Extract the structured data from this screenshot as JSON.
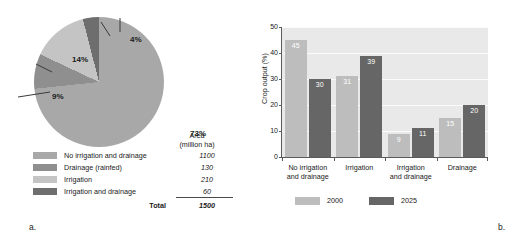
{
  "figure": {
    "panel_a_tag": "a.",
    "panel_b_tag": "b."
  },
  "colors": {
    "no_irrigation": "#a8a8a8",
    "drainage_rainfed": "#8f8f8f",
    "irrigation": "#c4c4c4",
    "irrigation_and_drainage": "#6e6e6e",
    "year_2000": "#bdbdbd",
    "year_2025": "#666666",
    "plot_background": "#e9e9e9",
    "gridline": "#fbfbfb",
    "axis": "#5a5a5a",
    "text": "#1a1a1a"
  },
  "pie_panel": {
    "labels": {
      "slice_73": "73%",
      "slice_14": "14%",
      "slice_9": "9%",
      "slice_4": "4%"
    },
    "legend_header_line1": "Area",
    "legend_header_line2": "(million ha)",
    "rows": [
      {
        "label": "No irrigation and drainage",
        "value": "1100",
        "color": "#a8a8a8"
      },
      {
        "label": "Drainage (rainfed)",
        "value": "130",
        "color": "#8f8f8f"
      },
      {
        "label": "Irrigation",
        "value": "210",
        "color": "#c4c4c4"
      },
      {
        "label": "Irrigation and drainage",
        "value": "60",
        "color": "#6e6e6e"
      }
    ],
    "total_label": "Total",
    "total_value": "1500"
  },
  "chart_data": [
    {
      "type": "pie",
      "title": "",
      "labels": [
        "No irrigation and drainage",
        "Drainage (rainfed)",
        "Irrigation",
        "Irrigation and drainage"
      ],
      "values": [
        1100,
        130,
        210,
        60
      ],
      "percent_labels": [
        "73%",
        "9%",
        "14%",
        "4%"
      ],
      "units": "million ha",
      "total": 1500,
      "colors": [
        "#a8a8a8",
        "#8f8f8f",
        "#c4c4c4",
        "#6e6e6e"
      ],
      "legend": "table at bottom with Area (million ha) column"
    },
    {
      "type": "bar",
      "title": "",
      "xlabel": "",
      "ylabel": "Crop output (%)",
      "categories": [
        "No irrigation and drainage",
        "Irrigation",
        "Irrigation and drainage",
        "Drainage"
      ],
      "category_lines": [
        [
          "No irrigation",
          "and drainage"
        ],
        [
          "Irrigation"
        ],
        [
          "Irrigation",
          "and drainage"
        ],
        [
          "Drainage"
        ]
      ],
      "series": [
        {
          "name": "2000",
          "values": [
            45,
            31,
            9,
            15
          ],
          "color": "#bdbdbd"
        },
        {
          "name": "2025",
          "values": [
            30,
            39,
            11,
            20
          ],
          "color": "#666666"
        }
      ],
      "ylim": [
        0,
        50
      ],
      "yticks": [
        "0",
        "10",
        "20",
        "30",
        "40",
        "50"
      ],
      "grid": true,
      "legend_position": "bottom-left"
    }
  ]
}
